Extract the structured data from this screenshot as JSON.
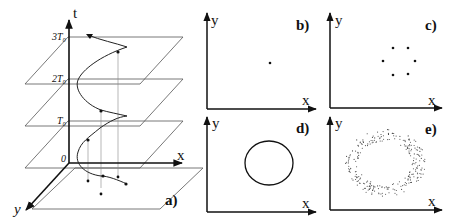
{
  "figure": {
    "panels": [
      {
        "id": "a",
        "label": "a)",
        "axes": {
          "vertical": "t",
          "horizontal": "x",
          "depth": "y"
        },
        "time_levels": [
          "0",
          "T0",
          "2T0",
          "3T0"
        ]
      },
      {
        "id": "b",
        "label": "b)",
        "axes": {
          "vertical": "y",
          "horizontal": "x"
        },
        "content": "single point"
      },
      {
        "id": "c",
        "label": "c)",
        "axes": {
          "vertical": "y",
          "horizontal": "x"
        },
        "content": "six points on a ring"
      },
      {
        "id": "d",
        "label": "d)",
        "axes": {
          "vertical": "y",
          "horizontal": "x"
        },
        "content": "closed ellipse"
      },
      {
        "id": "e",
        "label": "e)",
        "axes": {
          "vertical": "y",
          "horizontal": "x"
        },
        "content": "noisy ring of scattered points"
      }
    ],
    "panel_a": {
      "t_label": "t",
      "x_label": "x",
      "y_label": "y",
      "origin_label": "0",
      "t0_label": "T₀",
      "t2_label": "2T₀",
      "t3_label": "3T₀",
      "panel_label": "a)"
    },
    "panel_b": {
      "y_label": "y",
      "x_label": "x",
      "panel_label": "b)"
    },
    "panel_c": {
      "y_label": "y",
      "x_label": "x",
      "panel_label": "c)"
    },
    "panel_d": {
      "y_label": "y",
      "x_label": "x",
      "panel_label": "d)"
    },
    "panel_e": {
      "y_label": "y",
      "x_label": "x",
      "panel_label": "e)"
    },
    "colors": {
      "ink": "#111111",
      "plane": "#555555",
      "dropline": "#888888"
    }
  }
}
